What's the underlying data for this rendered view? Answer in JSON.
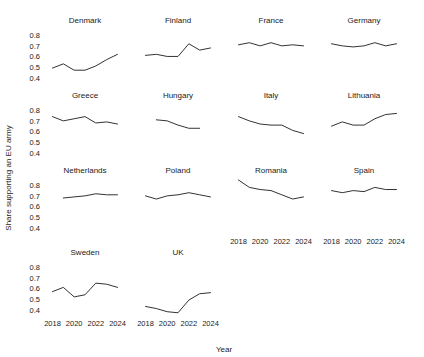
{
  "chart_data": {
    "type": "line",
    "title": "",
    "xlabel": "Year",
    "ylabel": "Share supporting an EU army",
    "xlim": [
      2017.4,
      2024.6
    ],
    "ylim": [
      0.33,
      0.85
    ],
    "grid": false,
    "legend": "none",
    "layout": "small-multiples faceted grid, 4 columns x 3 rows",
    "x_ticks": [
      2018,
      2020,
      2022,
      2024
    ],
    "x_tick_labels": [
      "2018",
      "2020",
      "2022",
      "2024"
    ],
    "y_ticks": [
      0.4,
      0.5,
      0.6,
      0.7,
      0.8
    ],
    "y_tick_labels": [
      "0.4",
      "0.5",
      "0.6",
      "0.7",
      "0.8"
    ],
    "panels": [
      {
        "name": "Denmark",
        "row": 0,
        "col": 0,
        "x": [
          2018,
          2019,
          2020,
          2021,
          2022,
          2023,
          2024
        ],
        "values": [
          0.49,
          0.53,
          0.47,
          0.47,
          0.51,
          0.57,
          0.62
        ]
      },
      {
        "name": "Finland",
        "row": 0,
        "col": 1,
        "x": [
          2018,
          2019,
          2020,
          2021,
          2022,
          2023,
          2024
        ],
        "values": [
          0.61,
          0.62,
          0.6,
          0.6,
          0.72,
          0.66,
          0.68
        ]
      },
      {
        "name": "France",
        "row": 0,
        "col": 2,
        "x": [
          2018,
          2019,
          2020,
          2021,
          2022,
          2023,
          2024
        ],
        "values": [
          0.71,
          0.73,
          0.7,
          0.73,
          0.7,
          0.71,
          0.7
        ]
      },
      {
        "name": "Germany",
        "row": 0,
        "col": 3,
        "x": [
          2018,
          2019,
          2020,
          2021,
          2022,
          2023,
          2024
        ],
        "values": [
          0.72,
          0.7,
          0.69,
          0.7,
          0.73,
          0.7,
          0.72
        ]
      },
      {
        "name": "Greece",
        "row": 1,
        "col": 0,
        "x": [
          2018,
          2019,
          2020,
          2021,
          2022,
          2023,
          2024
        ],
        "values": [
          0.74,
          0.7,
          0.72,
          0.74,
          0.68,
          0.69,
          0.67
        ]
      },
      {
        "name": "Hungary",
        "row": 1,
        "col": 1,
        "x": [
          2019,
          2020,
          2021,
          2022,
          2023
        ],
        "values": [
          0.71,
          0.7,
          0.66,
          0.63,
          0.63
        ]
      },
      {
        "name": "Italy",
        "row": 1,
        "col": 2,
        "x": [
          2018,
          2019,
          2020,
          2021,
          2022,
          2023,
          2024
        ],
        "values": [
          0.74,
          0.7,
          0.67,
          0.66,
          0.66,
          0.61,
          0.58
        ]
      },
      {
        "name": "Lithuania",
        "row": 1,
        "col": 3,
        "x": [
          2018,
          2019,
          2020,
          2021,
          2022,
          2023,
          2024
        ],
        "values": [
          0.65,
          0.69,
          0.66,
          0.66,
          0.72,
          0.76,
          0.77
        ]
      },
      {
        "name": "Netherlands",
        "row": 2,
        "col": 0,
        "x": [
          2019,
          2020,
          2021,
          2022,
          2023,
          2024
        ],
        "values": [
          0.68,
          0.69,
          0.7,
          0.72,
          0.71,
          0.71
        ]
      },
      {
        "name": "Poland",
        "row": 2,
        "col": 1,
        "x": [
          2018,
          2019,
          2020,
          2021,
          2022,
          2023,
          2024
        ],
        "values": [
          0.7,
          0.67,
          0.7,
          0.71,
          0.73,
          0.71,
          0.69
        ]
      },
      {
        "name": "Romania",
        "row": 2,
        "col": 2,
        "x": [
          2018,
          2019,
          2020,
          2021,
          2022,
          2023,
          2024
        ],
        "values": [
          0.85,
          0.78,
          0.76,
          0.75,
          0.71,
          0.67,
          0.69
        ]
      },
      {
        "name": "Spain",
        "row": 2,
        "col": 3,
        "x": [
          2018,
          2019,
          2020,
          2021,
          2022,
          2023,
          2024
        ],
        "values": [
          0.75,
          0.73,
          0.75,
          0.74,
          0.78,
          0.76,
          0.76
        ]
      },
      {
        "name": "Sweden",
        "row": 3,
        "col": 0,
        "x": [
          2018,
          2019,
          2020,
          2021,
          2022,
          2023,
          2024
        ],
        "values": [
          0.57,
          0.61,
          0.52,
          0.54,
          0.65,
          0.64,
          0.61
        ]
      },
      {
        "name": "UK",
        "row": 3,
        "col": 1,
        "x": [
          2018,
          2019,
          2020,
          2021,
          2022,
          2023,
          2024
        ],
        "values": [
          0.43,
          0.41,
          0.38,
          0.37,
          0.49,
          0.55,
          0.56
        ]
      }
    ]
  },
  "colors": {
    "line": "#333333",
    "text": "#1a1a1a",
    "background": "#ffffff"
  }
}
